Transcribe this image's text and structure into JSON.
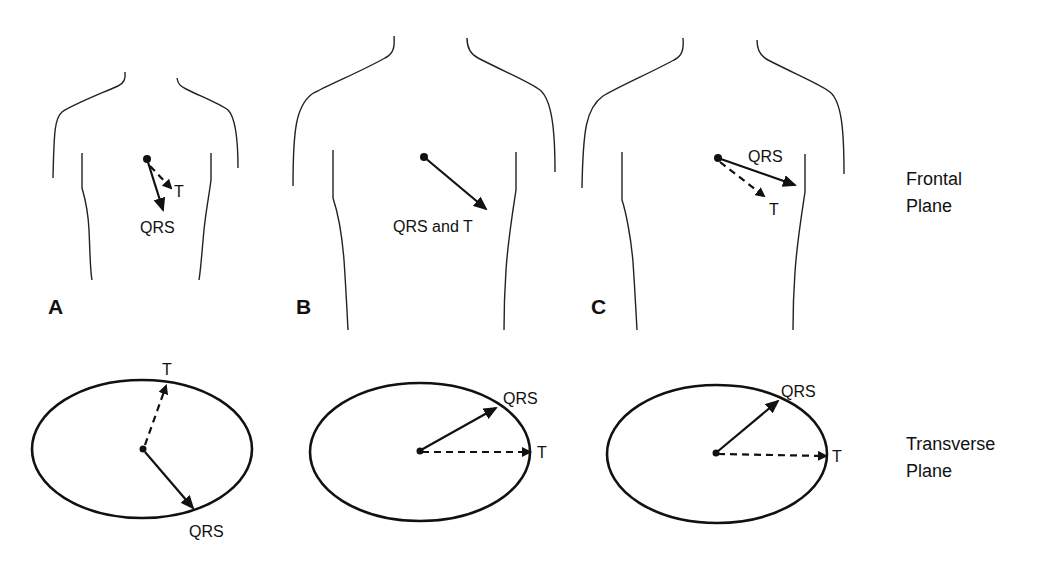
{
  "figure": {
    "rows": {
      "frontal": {
        "label_line1": "Frontal",
        "label_line2": "Plane"
      },
      "transverse": {
        "label_line1": "Transverse",
        "label_line2": "Plane"
      }
    },
    "panels": [
      {
        "id": "A",
        "letter": "A",
        "frontal": {
          "qrs_label": "QRS",
          "t_label": "T",
          "t_style": "dashed",
          "qrs_style": "solid"
        },
        "transverse": {
          "qrs_label": "QRS",
          "t_label": "T"
        }
      },
      {
        "id": "B",
        "letter": "B",
        "frontal": {
          "combined_label": "QRS and T",
          "style": "solid"
        },
        "transverse": {
          "qrs_label": "QRS",
          "t_label": "T"
        }
      },
      {
        "id": "C",
        "letter": "C",
        "frontal": {
          "qrs_label": "QRS",
          "t_label": "T",
          "t_style": "dashed",
          "qrs_style": "solid"
        },
        "transverse": {
          "qrs_label": "QRS",
          "t_label": "T"
        }
      }
    ],
    "legend_semantics": {
      "solid_arrow": "QRS vector",
      "dashed_arrow": "T vector"
    }
  }
}
